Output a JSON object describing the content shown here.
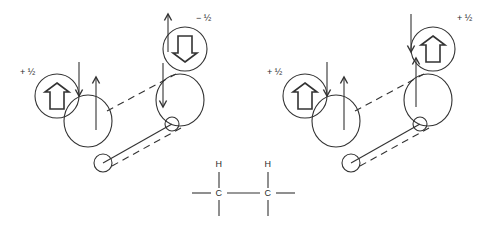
{
  "figure": {
    "background_color": "#ffffff",
    "stroke_color": "#333333",
    "panels": [
      {
        "id": "left-panel",
        "name": "antiperiplanar-opposite-spin-conformer",
        "spin_labels": [
          {
            "name": "left-spin-label",
            "text": "+ ½",
            "x": 20,
            "y": 75
          },
          {
            "name": "right-spin-label",
            "text": "− ½",
            "x": 196,
            "y": 21
          }
        ],
        "spin_circles": [
          {
            "name": "left-spin-circle",
            "cx": 57,
            "cy": 96,
            "r": 22,
            "arrow": "up"
          },
          {
            "name": "right-spin-circle",
            "cx": 185,
            "cy": 49,
            "r": 22,
            "arrow": "down"
          }
        ],
        "lobes": [
          {
            "name": "left-orbital-lobe",
            "cx": 88,
            "cy": 121,
            "rx": 24,
            "ry": 26
          },
          {
            "name": "right-orbital-lobe",
            "cx": 180,
            "cy": 100,
            "rx": 24,
            "ry": 26
          }
        ],
        "nuclei": [
          {
            "name": "left-nucleus",
            "cx": 103,
            "cy": 163,
            "r": 9
          },
          {
            "name": "right-nucleus",
            "cx": 172,
            "cy": 124,
            "r": 7
          }
        ],
        "thin_arrows": [
          {
            "name": "left-down-arrow",
            "x1": 79,
            "y1": 62,
            "x2": 79,
            "y2": 96,
            "dir": "down"
          },
          {
            "name": "left-up-arrow",
            "x1": 96,
            "y1": 130,
            "x2": 96,
            "y2": 77,
            "dir": "up"
          },
          {
            "name": "right-up-arrow",
            "x1": 168,
            "y1": 52,
            "x2": 168,
            "y2": 14,
            "dir": "up"
          },
          {
            "name": "right-down-arrow",
            "x1": 163,
            "y1": 63,
            "x2": 163,
            "y2": 107,
            "dir": "down"
          }
        ],
        "bond_lines": [
          {
            "name": "solid-bond-line",
            "x1": 103,
            "y1": 163,
            "x2": 172,
            "y2": 124,
            "style": "solid"
          },
          {
            "name": "upper-dashed-line",
            "x1": 107,
            "y1": 111,
            "x2": 176,
            "y2": 74,
            "style": "dashed"
          },
          {
            "name": "lower-dashed-line",
            "x1": 112,
            "y1": 166,
            "x2": 181,
            "y2": 128,
            "style": "dashed"
          }
        ]
      },
      {
        "id": "right-panel",
        "name": "antiperiplanar-parallel-spin-conformer",
        "spin_labels": [
          {
            "name": "left-spin-label",
            "text": "+ ½",
            "x": 267,
            "y": 75
          },
          {
            "name": "right-spin-label",
            "text": "+ ½",
            "x": 457,
            "y": 21
          }
        ],
        "spin_circles": [
          {
            "name": "left-spin-circle",
            "cx": 305,
            "cy": 96,
            "r": 22,
            "arrow": "up"
          },
          {
            "name": "right-spin-circle",
            "cx": 433,
            "cy": 49,
            "r": 22,
            "arrow": "up"
          }
        ],
        "lobes": [
          {
            "name": "left-orbital-lobe",
            "cx": 336,
            "cy": 121,
            "rx": 24,
            "ry": 26
          },
          {
            "name": "right-orbital-lobe",
            "cx": 428,
            "cy": 100,
            "rx": 24,
            "ry": 26
          }
        ],
        "nuclei": [
          {
            "name": "left-nucleus",
            "cx": 351,
            "cy": 163,
            "r": 9
          },
          {
            "name": "right-nucleus",
            "cx": 420,
            "cy": 124,
            "r": 7
          }
        ],
        "thin_arrows": [
          {
            "name": "left-down-arrow",
            "x1": 327,
            "y1": 62,
            "x2": 327,
            "y2": 96,
            "dir": "down"
          },
          {
            "name": "left-up-arrow",
            "x1": 344,
            "y1": 130,
            "x2": 344,
            "y2": 77,
            "dir": "up"
          },
          {
            "name": "right-up-arrow",
            "x1": 416,
            "y1": 107,
            "x2": 416,
            "y2": 58,
            "dir": "up"
          },
          {
            "name": "right-down-arrow",
            "x1": 411,
            "y1": 14,
            "x2": 411,
            "y2": 52,
            "dir": "down"
          }
        ],
        "bond_lines": [
          {
            "name": "solid-bond-line",
            "x1": 351,
            "y1": 163,
            "x2": 420,
            "y2": 124,
            "style": "solid"
          },
          {
            "name": "upper-dashed-line",
            "x1": 355,
            "y1": 111,
            "x2": 424,
            "y2": 74,
            "style": "dashed"
          },
          {
            "name": "lower-dashed-line",
            "x1": 360,
            "y1": 166,
            "x2": 429,
            "y2": 128,
            "style": "dashed"
          }
        ]
      }
    ],
    "skeletal_formula": {
      "name": "ethane-fragment-skeletal-formula",
      "atoms": [
        {
          "name": "hydrogen-left",
          "text": "H",
          "x": 219,
          "y": 167
        },
        {
          "name": "hydrogen-right",
          "text": "H",
          "x": 268,
          "y": 167
        },
        {
          "name": "carbon-left",
          "text": "C",
          "x": 219,
          "y": 196
        },
        {
          "name": "carbon-right",
          "text": "C",
          "x": 268,
          "y": 196
        }
      ],
      "bonds": [
        {
          "name": "c-left-h-bond",
          "x1": 219,
          "y1": 172,
          "x2": 219,
          "y2": 188
        },
        {
          "name": "c-right-h-bond",
          "x1": 268,
          "y1": 172,
          "x2": 268,
          "y2": 188
        },
        {
          "name": "c-left-stub-bond",
          "x1": 192,
          "y1": 193,
          "x2": 211,
          "y2": 193
        },
        {
          "name": "c-c-bond",
          "x1": 227,
          "y1": 193,
          "x2": 260,
          "y2": 193
        },
        {
          "name": "c-right-stub-bond",
          "x1": 276,
          "y1": 193,
          "x2": 295,
          "y2": 193
        },
        {
          "name": "c-left-down-bond",
          "x1": 219,
          "y1": 200,
          "x2": 219,
          "y2": 216
        },
        {
          "name": "c-right-down-bond",
          "x1": 268,
          "y1": 200,
          "x2": 268,
          "y2": 216
        }
      ]
    }
  }
}
